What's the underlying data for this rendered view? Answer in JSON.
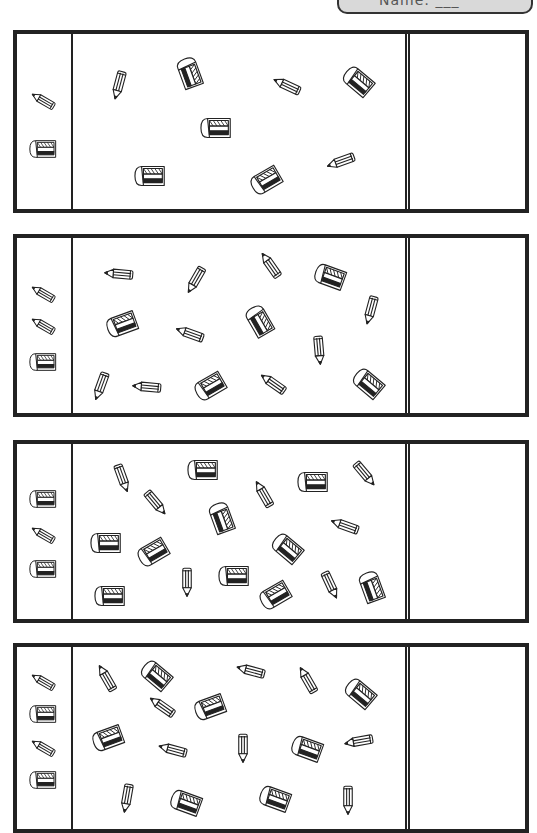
{
  "banner": {
    "text": "Name: ___"
  },
  "colors": {
    "ink": "#222222",
    "banner_bg": "#d9d9d9",
    "paper": "#ffffff"
  },
  "icons": {
    "pencil": "pencil-icon",
    "eraser": "eraser-icon"
  },
  "panels": [
    {
      "top": 30,
      "height": 183,
      "key": [
        {
          "type": "pencil",
          "x": 27,
          "y": 67,
          "rot": 30
        },
        {
          "type": "eraser",
          "x": 27,
          "y": 115,
          "rot": 0
        }
      ],
      "items": [
        {
          "type": "pencil",
          "x": 46,
          "y": 50,
          "rot": -75
        },
        {
          "type": "eraser",
          "x": 117,
          "y": 40,
          "rot": 70
        },
        {
          "type": "pencil",
          "x": 215,
          "y": 52,
          "rot": 25
        },
        {
          "type": "eraser",
          "x": 286,
          "y": 48,
          "rot": 40
        },
        {
          "type": "eraser",
          "x": 144,
          "y": 94,
          "rot": 0
        },
        {
          "type": "pencil",
          "x": 269,
          "y": 127,
          "rot": -20
        },
        {
          "type": "eraser",
          "x": 78,
          "y": 142,
          "rot": 0
        },
        {
          "type": "eraser",
          "x": 194,
          "y": 146,
          "rot": -30
        }
      ],
      "counts": {
        "pencil": 3,
        "eraser": 5
      }
    },
    {
      "top": 234,
      "height": 183,
      "key": [
        {
          "type": "pencil",
          "x": 27,
          "y": 56,
          "rot": 30
        },
        {
          "type": "pencil",
          "x": 27,
          "y": 88,
          "rot": 30
        },
        {
          "type": "eraser",
          "x": 27,
          "y": 124,
          "rot": 0
        }
      ],
      "items": [
        {
          "type": "pencil",
          "x": 47,
          "y": 36,
          "rot": 5
        },
        {
          "type": "pencil",
          "x": 123,
          "y": 41,
          "rot": -60
        },
        {
          "type": "pencil",
          "x": 198,
          "y": 28,
          "rot": 55
        },
        {
          "type": "eraser",
          "x": 258,
          "y": 39,
          "rot": 20
        },
        {
          "type": "pencil",
          "x": 298,
          "y": 71,
          "rot": -75
        },
        {
          "type": "eraser",
          "x": 50,
          "y": 86,
          "rot": -20
        },
        {
          "type": "pencil",
          "x": 118,
          "y": 96,
          "rot": 20
        },
        {
          "type": "eraser",
          "x": 187,
          "y": 84,
          "rot": 60
        },
        {
          "type": "pencil",
          "x": 246,
          "y": 111,
          "rot": -95
        },
        {
          "type": "pencil",
          "x": 28,
          "y": 147,
          "rot": -70
        },
        {
          "type": "pencil",
          "x": 75,
          "y": 149,
          "rot": 5
        },
        {
          "type": "eraser",
          "x": 138,
          "y": 148,
          "rot": -30
        },
        {
          "type": "pencil",
          "x": 201,
          "y": 146,
          "rot": 35
        },
        {
          "type": "eraser",
          "x": 296,
          "y": 146,
          "rot": 40
        }
      ],
      "counts": {
        "pencil": 9,
        "eraser": 5
      }
    },
    {
      "top": 440,
      "height": 183,
      "key": [
        {
          "type": "eraser",
          "x": 27,
          "y": 55,
          "rot": 0
        },
        {
          "type": "pencil",
          "x": 27,
          "y": 91,
          "rot": 30
        },
        {
          "type": "eraser",
          "x": 27,
          "y": 125,
          "rot": 0
        }
      ],
      "items": [
        {
          "type": "pencil",
          "x": 49,
          "y": 33,
          "rot": -110
        },
        {
          "type": "eraser",
          "x": 131,
          "y": 26,
          "rot": 0
        },
        {
          "type": "pencil",
          "x": 191,
          "y": 51,
          "rot": 60
        },
        {
          "type": "eraser",
          "x": 241,
          "y": 38,
          "rot": 0
        },
        {
          "type": "pencil",
          "x": 291,
          "y": 29,
          "rot": -130
        },
        {
          "type": "pencil",
          "x": 82,
          "y": 58,
          "rot": -130
        },
        {
          "type": "eraser",
          "x": 149,
          "y": 75,
          "rot": 70
        },
        {
          "type": "pencil",
          "x": 273,
          "y": 82,
          "rot": 20
        },
        {
          "type": "eraser",
          "x": 34,
          "y": 99,
          "rot": 0
        },
        {
          "type": "eraser",
          "x": 81,
          "y": 108,
          "rot": -30
        },
        {
          "type": "eraser",
          "x": 215,
          "y": 105,
          "rot": 40
        },
        {
          "type": "pencil",
          "x": 114,
          "y": 137,
          "rot": -90
        },
        {
          "type": "eraser",
          "x": 162,
          "y": 132,
          "rot": 0
        },
        {
          "type": "eraser",
          "x": 38,
          "y": 152,
          "rot": 0
        },
        {
          "type": "eraser",
          "x": 203,
          "y": 151,
          "rot": -30
        },
        {
          "type": "pencil",
          "x": 257,
          "y": 140,
          "rot": -115
        },
        {
          "type": "eraser",
          "x": 299,
          "y": 144,
          "rot": 70
        }
      ],
      "counts": {
        "pencil": 7,
        "eraser": 10
      }
    },
    {
      "top": 643,
      "height": 190,
      "key": [
        {
          "type": "pencil",
          "x": 27,
          "y": 35,
          "rot": 30
        },
        {
          "type": "eraser",
          "x": 27,
          "y": 67,
          "rot": 0
        },
        {
          "type": "pencil",
          "x": 27,
          "y": 101,
          "rot": 30
        },
        {
          "type": "eraser",
          "x": 27,
          "y": 133,
          "rot": 0
        }
      ],
      "items": [
        {
          "type": "pencil",
          "x": 34,
          "y": 32,
          "rot": 60
        },
        {
          "type": "eraser",
          "x": 84,
          "y": 29,
          "rot": 40
        },
        {
          "type": "pencil",
          "x": 179,
          "y": 24,
          "rot": 15
        },
        {
          "type": "pencil",
          "x": 235,
          "y": 34,
          "rot": 60
        },
        {
          "type": "eraser",
          "x": 288,
          "y": 47,
          "rot": 40
        },
        {
          "type": "pencil",
          "x": 90,
          "y": 60,
          "rot": 35
        },
        {
          "type": "eraser",
          "x": 138,
          "y": 60,
          "rot": -20
        },
        {
          "type": "eraser",
          "x": 36,
          "y": 91,
          "rot": -20
        },
        {
          "type": "pencil",
          "x": 101,
          "y": 103,
          "rot": 15
        },
        {
          "type": "pencil",
          "x": 170,
          "y": 100,
          "rot": -90
        },
        {
          "type": "eraser",
          "x": 235,
          "y": 102,
          "rot": 20
        },
        {
          "type": "pencil",
          "x": 287,
          "y": 94,
          "rot": -10
        },
        {
          "type": "pencil",
          "x": 54,
          "y": 150,
          "rot": -80
        },
        {
          "type": "eraser",
          "x": 114,
          "y": 156,
          "rot": 20
        },
        {
          "type": "eraser",
          "x": 203,
          "y": 152,
          "rot": 20
        },
        {
          "type": "pencil",
          "x": 275,
          "y": 152,
          "rot": -90
        }
      ],
      "counts": {
        "pencil": 9,
        "eraser": 7
      }
    }
  ]
}
